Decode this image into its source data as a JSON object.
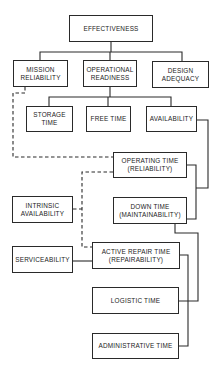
{
  "diagram": {
    "nodes": {
      "effectiveness": {
        "line1": "EFFECTIVENESS",
        "line2": ""
      },
      "mission_reliability": {
        "line1": "MISSION",
        "line2": "RELIABILITY"
      },
      "operational_readiness": {
        "line1": "OPERATIONAL",
        "line2": "READINESS"
      },
      "design_adequacy": {
        "line1": "DESIGN",
        "line2": "ADEQUACY"
      },
      "storage_time": {
        "line1": "STORAGE",
        "line2": "TIME"
      },
      "free_time": {
        "line1": "FREE TIME",
        "line2": ""
      },
      "availability": {
        "line1": "AVAILABILITY",
        "line2": ""
      },
      "operating_time": {
        "line1": "OPERATING TIME",
        "line2": "(RELIABILITY)"
      },
      "down_time": {
        "line1": "DOWN TIME",
        "line2": "(MAINTAINABILITY)"
      },
      "intrinsic_availability": {
        "line1": "INTRINSIC",
        "line2": "AVAILABILITY"
      },
      "serviceability": {
        "line1": "SERVICEABILITY",
        "line2": ""
      },
      "active_repair_time": {
        "line1": "ACTIVE REPAIR TIME",
        "line2": "(REPAIRABILITY)"
      },
      "logistic_time": {
        "line1": "LOGISTIC TIME",
        "line2": ""
      },
      "administrative_time": {
        "line1": "ADMINISTRATIVE TIME",
        "line2": ""
      }
    },
    "edges": [
      {
        "from": "effectiveness",
        "to": "mission_reliability",
        "style": "solid"
      },
      {
        "from": "effectiveness",
        "to": "operational_readiness",
        "style": "solid"
      },
      {
        "from": "effectiveness",
        "to": "design_adequacy",
        "style": "solid"
      },
      {
        "from": "operational_readiness",
        "to": "storage_time",
        "style": "solid"
      },
      {
        "from": "operational_readiness",
        "to": "free_time",
        "style": "solid"
      },
      {
        "from": "operational_readiness",
        "to": "availability",
        "style": "solid"
      },
      {
        "from": "availability",
        "to": "operating_time",
        "style": "solid"
      },
      {
        "from": "availability",
        "to": "down_time",
        "style": "solid"
      },
      {
        "from": "mission_reliability",
        "to": "operating_time",
        "style": "dashed"
      },
      {
        "from": "intrinsic_availability",
        "to": "operating_time",
        "style": "dashed"
      },
      {
        "from": "intrinsic_availability",
        "to": "active_repair_time",
        "style": "dashed"
      },
      {
        "from": "serviceability",
        "to": "active_repair_time",
        "style": "solid"
      },
      {
        "from": "down_time",
        "to": "active_repair_time",
        "style": "solid"
      },
      {
        "from": "down_time",
        "to": "logistic_time",
        "style": "solid"
      },
      {
        "from": "down_time",
        "to": "administrative_time",
        "style": "solid"
      }
    ],
    "colors": {
      "line": "#2a2a2a",
      "background": "#ffffff"
    }
  }
}
